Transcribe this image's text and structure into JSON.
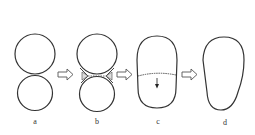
{
  "diagram": {
    "stages": [
      {
        "id": "a",
        "label": "a",
        "description": "two touching circles"
      },
      {
        "id": "b",
        "label": "b",
        "description": "circles with neck fillets forming"
      },
      {
        "id": "c",
        "label": "c",
        "description": "merged capsule with dashed interface and downward arrow"
      },
      {
        "id": "d",
        "label": "d",
        "description": "final egg-shaped single body"
      }
    ],
    "arrows": [
      {
        "from": "a",
        "to": "b"
      },
      {
        "from": "b",
        "to": "c"
      },
      {
        "from": "c",
        "to": "d"
      }
    ],
    "colors": {
      "stroke": "#333333",
      "background": "#ffffff",
      "arrow_stroke": "#555555"
    }
  }
}
